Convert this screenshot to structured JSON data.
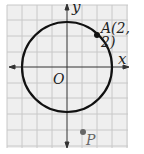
{
  "diagram": {
    "type": "coordinate-plane",
    "axes": {
      "x_label": "x",
      "y_label": "y",
      "origin_label": "O"
    },
    "grid": {
      "x_min": -4,
      "x_max": 4,
      "y_min": -5,
      "y_max": 4,
      "unit": 1
    },
    "circle": {
      "center": [
        0,
        0
      ],
      "radius": 2.83,
      "passes_through": "A"
    },
    "points": [
      {
        "name": "A",
        "label": "A(2, 2)",
        "x": 2,
        "y": 2
      },
      {
        "name": "P",
        "label": "P",
        "x": 1,
        "y": -4.3
      }
    ],
    "colors": {
      "grid": "#c8c8c8",
      "grid_bg": "#efefef",
      "curve": "#111111",
      "point_A": "#111111",
      "point_P": "#666666"
    }
  }
}
